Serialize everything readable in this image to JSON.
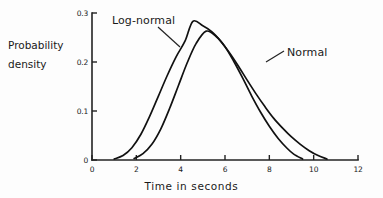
{
  "figure": {
    "background_color": "#fdfdfd",
    "ink_color": "#111111"
  },
  "axis_labels": {
    "y_line1": "Probability",
    "y_line2": "density",
    "x": "Time in seconds"
  },
  "annotations": {
    "lognormal": "Log-normal",
    "normal": "Normal"
  },
  "chart_data": {
    "type": "line",
    "title": "",
    "subtitle": "",
    "xlabel": "Time in seconds",
    "ylabel": "Probability density",
    "xlim": [
      0,
      12
    ],
    "ylim": [
      0,
      0.3
    ],
    "xticks": [
      0,
      2,
      4,
      6,
      8,
      10,
      12
    ],
    "xtick_labels": [
      "0",
      "2",
      "4",
      "6",
      "8",
      "10",
      "12"
    ],
    "yticks": [
      0,
      0.1,
      0.2,
      0.3
    ],
    "ytick_labels": [
      "0",
      "0.1",
      "0.2",
      "0.3"
    ],
    "grid": false,
    "legend": "annotated-inline",
    "legend_position": "inline-callouts",
    "series": [
      {
        "name": "Log-normal",
        "peak_x": 4.55,
        "peak_y": 0.283,
        "x_start": 1.0,
        "x_end": 10.6,
        "x": [
          1.0,
          1.4,
          1.8,
          2.2,
          2.6,
          3.0,
          3.4,
          3.8,
          4.2,
          4.55,
          5.0,
          5.4,
          5.8,
          6.2,
          6.6,
          7.0,
          7.4,
          7.8,
          8.2,
          8.6,
          9.0,
          9.4,
          9.8,
          10.2,
          10.6
        ],
        "y": [
          0.002,
          0.009,
          0.025,
          0.052,
          0.089,
          0.131,
          0.173,
          0.211,
          0.243,
          0.283,
          0.274,
          0.262,
          0.243,
          0.219,
          0.192,
          0.163,
          0.135,
          0.109,
          0.085,
          0.065,
          0.047,
          0.032,
          0.019,
          0.009,
          0.002
        ]
      },
      {
        "name": "Normal",
        "peak_x": 5.15,
        "peak_y": 0.263,
        "x_start": 1.9,
        "x_end": 9.5,
        "x": [
          1.9,
          2.3,
          2.7,
          3.1,
          3.5,
          3.9,
          4.3,
          4.7,
          5.15,
          5.6,
          6.0,
          6.4,
          6.8,
          7.2,
          7.6,
          8.0,
          8.4,
          8.8,
          9.1,
          9.5
        ],
        "y": [
          0.003,
          0.013,
          0.032,
          0.063,
          0.105,
          0.152,
          0.199,
          0.238,
          0.263,
          0.252,
          0.231,
          0.201,
          0.167,
          0.131,
          0.098,
          0.069,
          0.044,
          0.024,
          0.012,
          0.002
        ]
      }
    ],
    "callouts": [
      {
        "label": "Log-normal",
        "points_to_x": 4.0,
        "points_to_y": 0.23
      },
      {
        "label": "Normal",
        "points_to_x": 6.6,
        "points_to_y": 0.2
      }
    ]
  }
}
